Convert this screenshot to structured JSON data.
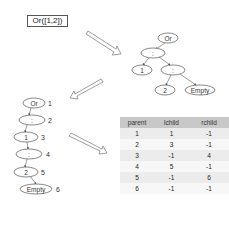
{
  "expression": "Or([1,2])",
  "tree": {
    "nodes": [
      {
        "id": "or",
        "label": "Or"
      },
      {
        "id": "cons1",
        "label": ":"
      },
      {
        "id": "one",
        "label": "1"
      },
      {
        "id": "cons2",
        "label": ":"
      },
      {
        "id": "two",
        "label": "2"
      },
      {
        "id": "empty",
        "label": "Empty"
      }
    ]
  },
  "linear": {
    "nodes": [
      {
        "label": "Or",
        "index": "1"
      },
      {
        "label": ":",
        "index": "2"
      },
      {
        "label": "1",
        "index": "3"
      },
      {
        "label": ":",
        "index": "4"
      },
      {
        "label": "2",
        "index": "5"
      },
      {
        "label": "Empty",
        "index": "6"
      }
    ]
  },
  "table": {
    "headers": [
      "parent",
      "lchild",
      "rchild"
    ],
    "rows": [
      [
        "1",
        "1",
        "-1"
      ],
      [
        "2",
        "3",
        "-1"
      ],
      [
        "3",
        "-1",
        "4"
      ],
      [
        "4",
        "5",
        "-1"
      ],
      [
        "5",
        "-1",
        "6"
      ],
      [
        "6",
        "-1",
        "-1"
      ]
    ]
  }
}
